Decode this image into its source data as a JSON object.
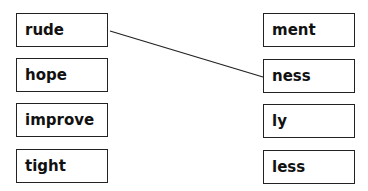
{
  "left_words": [
    "rude",
    "hope",
    "improve",
    "tight"
  ],
  "right_suffixes": [
    "ment",
    "ness",
    "ly",
    "less"
  ],
  "connections": [
    {
      "from": "rude",
      "to": "ness"
    }
  ]
}
